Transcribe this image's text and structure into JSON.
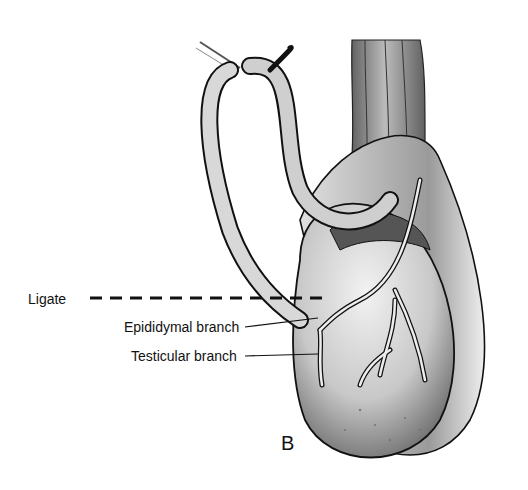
{
  "figure": {
    "panel_letter": "B",
    "labels": [
      {
        "id": "ligate",
        "text": "Ligate"
      },
      {
        "id": "epididymal",
        "text": "Epididymal branch"
      },
      {
        "id": "testicular",
        "text": "Testicular branch"
      }
    ],
    "colors": {
      "ink": "#111111",
      "shade": "#6a6a6a",
      "paper": "#ffffff"
    }
  }
}
